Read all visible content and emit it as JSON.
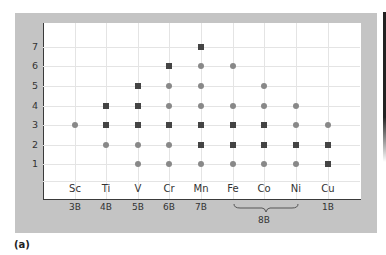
{
  "caption": "(a)",
  "chart_data": {
    "type": "scatter",
    "title": "",
    "xlabel": "",
    "ylabel": "",
    "ylim": [
      0,
      7
    ],
    "y_ticks": [
      "1",
      "2",
      "3",
      "4",
      "5",
      "6",
      "7"
    ],
    "categories": [
      "Sc",
      "Ti",
      "V",
      "Cr",
      "Mn",
      "Fe",
      "Co",
      "Ni",
      "Cu"
    ],
    "groups": [
      "3B",
      "4B",
      "5B",
      "6B",
      "7B",
      "8B",
      "8B",
      "8B",
      "1B"
    ],
    "group_labels": [
      "3B",
      "4B",
      "5B",
      "6B",
      "7B",
      "8B",
      "1B"
    ],
    "legend": {
      "square": "common (dark square)",
      "circle": "less common (gray circle)"
    },
    "series": [
      {
        "name": "square",
        "color": "#444444",
        "points": {
          "Sc": [],
          "Ti": [
            4,
            3
          ],
          "V": [
            5,
            4,
            3
          ],
          "Cr": [
            6,
            3
          ],
          "Mn": [
            7,
            3,
            2
          ],
          "Fe": [
            3,
            2
          ],
          "Co": [
            3,
            2
          ],
          "Ni": [
            2
          ],
          "Cu": [
            2,
            1
          ]
        }
      },
      {
        "name": "circle",
        "color": "#888888",
        "points": {
          "Sc": [
            3
          ],
          "Ti": [
            2
          ],
          "V": [
            2,
            1
          ],
          "Cr": [
            5,
            4,
            2,
            1
          ],
          "Mn": [
            6,
            5,
            4,
            1
          ],
          "Fe": [
            6,
            4,
            1
          ],
          "Co": [
            5,
            4,
            1
          ],
          "Ni": [
            4,
            3,
            1
          ],
          "Cu": [
            3
          ]
        }
      }
    ],
    "grid": true
  },
  "colors": {
    "panel": "#c4c4c4",
    "square": "#444444",
    "circle": "#888888"
  }
}
